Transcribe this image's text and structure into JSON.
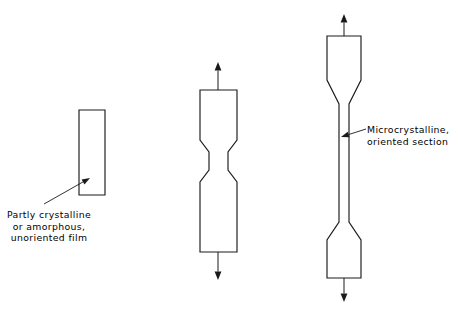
{
  "figure": {
    "background": "#ffffff",
    "line_color": "#1a1a1a",
    "width": 460,
    "height": 314
  },
  "callouts": {
    "left": {
      "name": "undrawn-film-label",
      "lines": [
        "Partly crystalline",
        "or amorphous,",
        "unoriented film"
      ],
      "leader": {
        "from_x": 44,
        "from_y": 204,
        "to_x": 90,
        "to_y": 178
      }
    },
    "right": {
      "name": "oriented-section-label",
      "lines": [
        "Microcrystalline,",
        "oriented section"
      ],
      "leader": {
        "from_x": 366,
        "from_y": 129,
        "to_x": 341,
        "to_y": 137
      }
    }
  },
  "specimens": [
    {
      "name": "specimen-undrawn",
      "stage": "unoriented film",
      "outline": "M 79 110 L 105 110 L 105 195 L 79 195 Z",
      "arrows": []
    },
    {
      "name": "specimen-necking",
      "stage": "necking begins",
      "outline": "M 200 90 L 237 90 L 237 140 L 228 152 L 228 170 L 237 182 L 237 252 L 200 252 L 200 182 L 209 170 L 209 152 L 200 140 Z",
      "arrows": [
        {
          "name": "tensile-arrow-up",
          "direction": "up",
          "x": 218,
          "tail_y": 90,
          "tip_y": 62
        },
        {
          "name": "tensile-arrow-down",
          "direction": "down",
          "x": 218,
          "tail_y": 252,
          "tip_y": 280
        }
      ]
    },
    {
      "name": "specimen-drawn",
      "stage": "fully drawn, oriented",
      "outline": "M 327 36 L 361 36 L 361 80 L 349 104 L 349 222 L 361 240 L 361 278 L 327 278 L 327 240 L 339 222 L 339 104 L 327 80 Z",
      "arrows": [
        {
          "name": "tensile-arrow-up",
          "direction": "up",
          "x": 344,
          "tail_y": 36,
          "tip_y": 14
        },
        {
          "name": "tensile-arrow-down",
          "direction": "down",
          "x": 344,
          "tail_y": 278,
          "tip_y": 302
        }
      ]
    }
  ]
}
